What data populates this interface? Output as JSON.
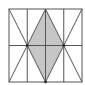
{
  "diagram": {
    "colors": {
      "background": "#ffffff",
      "line": "#555555",
      "shade": "#c6c6c6"
    },
    "square": {
      "x": 9,
      "y": 9,
      "size": 73
    },
    "vertical_lines_x": [
      27.25,
      45.5,
      63.75
    ],
    "horizontal_lines_y": [
      45.5
    ],
    "shaded_rhombus": [
      [
        45.5,
        9
      ],
      [
        63.75,
        45.5
      ],
      [
        45.5,
        82
      ],
      [
        27.25,
        45.5
      ]
    ],
    "diagonals": [
      [
        [
          9,
          9
        ],
        [
          27.25,
          45.5
        ]
      ],
      [
        [
          27.25,
          45.5
        ],
        [
          9,
          82
        ]
      ],
      [
        [
          82,
          9
        ],
        [
          63.75,
          45.5
        ]
      ],
      [
        [
          63.75,
          45.5
        ],
        [
          82,
          82
        ]
      ]
    ],
    "vertices": [
      [
        27.25,
        45.5
      ],
      [
        63.75,
        45.5
      ],
      [
        45.5,
        82
      ]
    ]
  }
}
